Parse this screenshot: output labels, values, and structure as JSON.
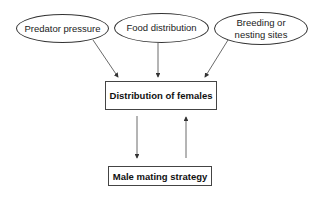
{
  "diagram": {
    "factors": [
      {
        "label": "Predator pressure"
      },
      {
        "label": "Food distribution"
      },
      {
        "label": "Breeding or nesting sites",
        "lines": [
          "Breeding or",
          "nesting sites"
        ]
      }
    ],
    "central_box": {
      "label": "Distribution of females"
    },
    "bottom_box": {
      "label": "Male mating strategy"
    },
    "edges": [
      {
        "from": "Predator pressure",
        "to": "Distribution of females"
      },
      {
        "from": "Food distribution",
        "to": "Distribution of females"
      },
      {
        "from": "Breeding or nesting sites",
        "to": "Distribution of females"
      },
      {
        "from": "Distribution of females",
        "to": "Male mating strategy"
      },
      {
        "from": "Male mating strategy",
        "to": "Distribution of females"
      }
    ]
  }
}
